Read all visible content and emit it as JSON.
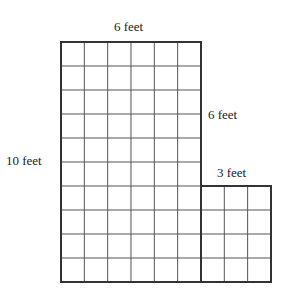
{
  "diagram": {
    "type": "area-grid-figure",
    "labels": {
      "top": "6 feet",
      "right_upper": "6 feet",
      "left": "10 feet",
      "step": "3 feet"
    },
    "shapes": [
      {
        "name": "tall-rectangle",
        "cols": 6,
        "rows": 10
      },
      {
        "name": "small-rectangle",
        "cols": 3,
        "rows": 4
      }
    ],
    "colors": {
      "line": "#333333",
      "background": "#ffffff"
    }
  }
}
